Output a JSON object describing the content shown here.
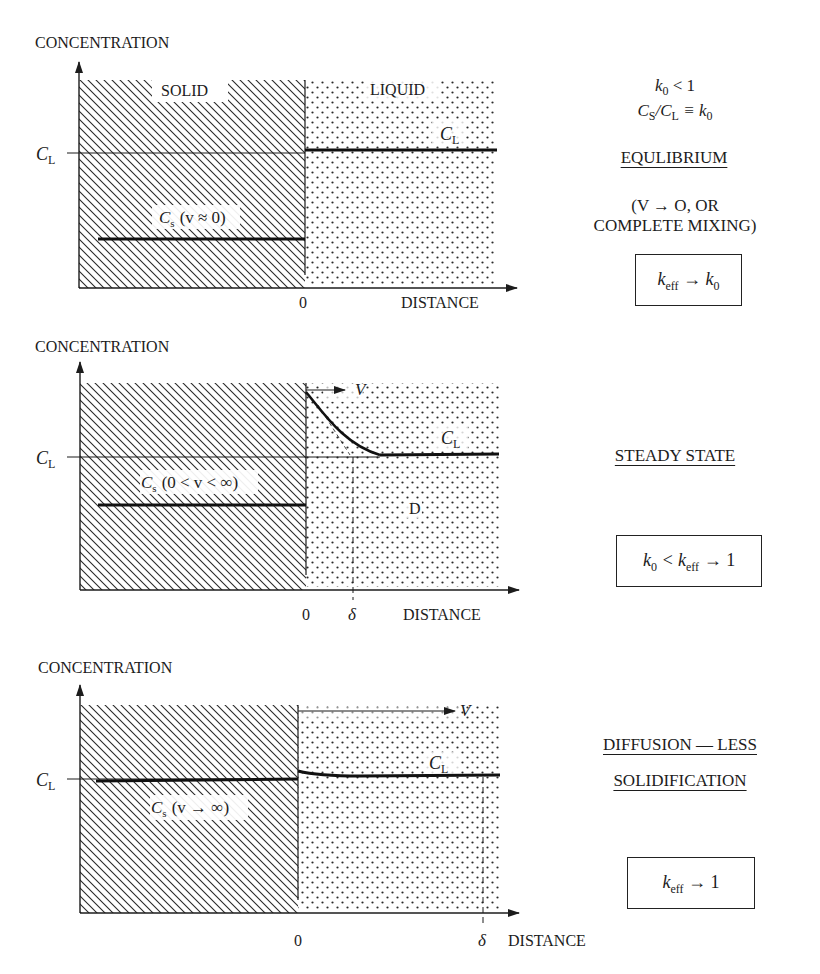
{
  "common": {
    "y_axis_label": "CONCENTRATION",
    "x_axis_label": "DISTANCE",
    "c_l_tick_label": "C",
    "c_l_tick_sub": "L",
    "origin_label": "0",
    "liquid_curve_label": "C",
    "liquid_curve_sub": "L"
  },
  "panel1": {
    "solid_label": "SOLID",
    "liquid_label": "LIQUID",
    "cs_label_main": "C",
    "cs_label_sub": "s",
    "cs_label_cond": "(v ≈ 0)",
    "condition_line1_k": "k",
    "condition_line1_sub": "0",
    "condition_line1_rest": " < 1",
    "condition_line2": "C",
    "condition_line2_sub1": "S",
    "condition_line2_mid": "/C",
    "condition_line2_sub2": "L",
    "condition_line2_rest": " ≡ k",
    "condition_line2_sub3": "0",
    "title": "EQULIBRIUM",
    "note_line1": "(V → O, OR",
    "note_line2": "COMPLETE MIXING)",
    "box_k": "k",
    "box_sub": "eff",
    "box_rest": " → k",
    "box_sub2": "0"
  },
  "panel2": {
    "velocity_label": "V",
    "cs_label_main": "C",
    "cs_label_sub": "s",
    "cs_label_cond": "(0 < v < ∞)",
    "diffusion_label": "D",
    "delta_label": "δ",
    "title": "STEADY STATE",
    "box_k0": "k",
    "box_sub0": "0",
    "box_mid": " < k",
    "box_sub": "eff",
    "box_rest": " → 1"
  },
  "panel3": {
    "velocity_label": "V",
    "cs_label_main": "C",
    "cs_label_sub": "s",
    "cs_label_cond": "(v → ∞)",
    "delta_label": "δ",
    "title_line1": "DIFFUSION — LESS",
    "title_line2": "SOLIDIFICATION",
    "box_k": "k",
    "box_sub": "eff",
    "box_rest": " → 1"
  },
  "colors": {
    "ink": "#1c1c1c",
    "background": "#ffffff"
  }
}
